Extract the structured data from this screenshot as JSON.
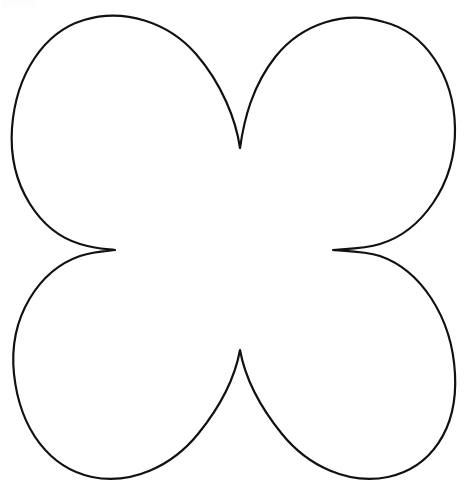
{
  "document": {
    "title": "Four Petal Flower Outline Template",
    "kind": "line-art-coloring-template",
    "width": 469,
    "height": 484,
    "background_color": "#ffffff"
  },
  "artwork": {
    "name": "four-petal-flower-outline",
    "description": "Symmetric four petal flower / clover silhouette drawn as a single closed black outline on a plain white field, with no fill and no text.",
    "stroke_color": "#111111",
    "fill_color": "none",
    "stroke_width": 2.2,
    "symmetry": "four-fold, mirrored horizontally and vertically",
    "petals": [
      {
        "name": "petal-top-left",
        "apex_x": 105,
        "apex_y": 17
      },
      {
        "name": "petal-top-right",
        "apex_x": 370,
        "apex_y": 23
      },
      {
        "name": "petal-bottom-right",
        "apex_x": 370,
        "apex_y": 473
      },
      {
        "name": "petal-bottom-left",
        "apex_x": 110,
        "apex_y": 475
      }
    ],
    "notches": [
      {
        "name": "notch-top",
        "tip_x": 240,
        "tip_y": 148
      },
      {
        "name": "notch-right",
        "tip_x": 333,
        "tip_y": 250
      },
      {
        "name": "notch-bottom",
        "tip_x": 240,
        "tip_y": 350
      },
      {
        "name": "notch-left",
        "tip_x": 115,
        "tip_y": 250
      }
    ],
    "extents": {
      "left": 12,
      "right": 456,
      "top": 17,
      "bottom": 475
    },
    "path": "M 240 148 C 236 120 222 84 196 54 C 168 22 124 8 84 20 C 44 32 16 74 12 128 C 8 186 40 232 80 244 C 96 249 108 249 115 250 C 108 251 96 251 80 256 C 40 270 8 316 14 374 C 20 430 50 468 92 477 C 132 485 172 466 198 434 C 224 402 236 372 240 350 C 244 372 256 402 282 434 C 308 466 348 485 388 477 C 430 468 458 430 455 374 C 452 316 420 270 380 256 C 364 251 341 251 333 250 C 341 249 364 249 380 244 C 420 232 456 186 455 128 C 454 74 424 32 384 22 C 344 10 302 24 276 56 C 252 86 244 120 240 148 Z"
  },
  "corner_artifact": {
    "name": "scan-artifact-top-left",
    "color": "#fcfcfd",
    "visible": true
  }
}
